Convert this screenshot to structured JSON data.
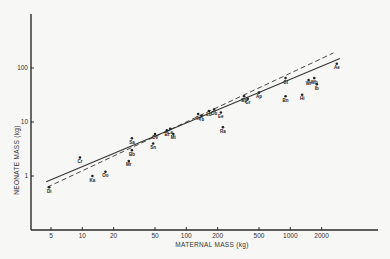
{
  "chart_data": {
    "type": "scatter",
    "title": "",
    "xlabel": "MATERNAL MASS (kg)",
    "ylabel": "NEONATE MASS (kg)",
    "xscale": "log",
    "yscale": "log",
    "xlim": [
      3,
      4000
    ],
    "ylim": [
      0.1,
      1000
    ],
    "x_ticks": [
      5,
      10,
      20,
      50,
      100,
      200,
      500,
      1000,
      2000
    ],
    "x_tick_labels": [
      "5",
      "10",
      "20",
      "50",
      "100",
      "200",
      "500",
      "1000",
      "2000"
    ],
    "y_ticks": [
      1,
      10,
      100
    ],
    "y_tick_labels": [
      "1",
      "10",
      "100"
    ],
    "grid": false,
    "legend": null,
    "points": [
      {
        "label": "Di",
        "x": 4.8,
        "y": 0.62
      },
      {
        "label": "Cr",
        "x": 9.5,
        "y": 2.2
      },
      {
        "label": "Ka",
        "x": 12.5,
        "y": 1.0
      },
      {
        "label": "Oo",
        "x": 16.7,
        "y": 1.2
      },
      {
        "label": "Mr",
        "x": 28,
        "y": 1.9
      },
      {
        "label": "Sa",
        "x": 30,
        "y": 5.0
      },
      {
        "label": "Bb",
        "x": 30,
        "y": 3.0
      },
      {
        "label": "Sn",
        "x": 48,
        "y": 4.0
      },
      {
        "label": "Ov",
        "x": 50,
        "y": 6.0
      },
      {
        "label": "Bt",
        "x": 65,
        "y": 7.0
      },
      {
        "label": "Ce",
        "x": 70,
        "y": 7.5
      },
      {
        "label": "Mi",
        "x": 75,
        "y": 6.0
      },
      {
        "label": "Ts",
        "x": 130,
        "y": 14
      },
      {
        "label": "Tb",
        "x": 140,
        "y": 13
      },
      {
        "label": "Lb",
        "x": 165,
        "y": 16
      },
      {
        "label": "Ob",
        "x": 185,
        "y": 17
      },
      {
        "label": "Ee",
        "x": 215,
        "y": 15
      },
      {
        "label": "Ra",
        "x": 225,
        "y": 8
      },
      {
        "label": "Bp",
        "x": 360,
        "y": 30
      },
      {
        "label": "Gr",
        "x": 390,
        "y": 27
      },
      {
        "label": "Ap",
        "x": 500,
        "y": 35
      },
      {
        "label": "Gi",
        "x": 900,
        "y": 65
      },
      {
        "label": "Bn",
        "x": 900,
        "y": 30
      },
      {
        "label": "Hi",
        "x": 1300,
        "y": 32
      },
      {
        "label": "Wr",
        "x": 1500,
        "y": 60
      },
      {
        "label": "Wb",
        "x": 1700,
        "y": 65
      },
      {
        "label": "Ib",
        "x": 1800,
        "y": 50
      },
      {
        "label": "Ae",
        "x": 2800,
        "y": 120
      }
    ],
    "series": [
      {
        "name": "solid regression line",
        "style": "solid",
        "x": [
          4.5,
          3000
        ],
        "y": [
          0.78,
          150
        ]
      },
      {
        "name": "dashed regression line",
        "style": "dashed",
        "x": [
          4.6,
          2600
        ],
        "y": [
          0.62,
          190
        ]
      }
    ]
  }
}
